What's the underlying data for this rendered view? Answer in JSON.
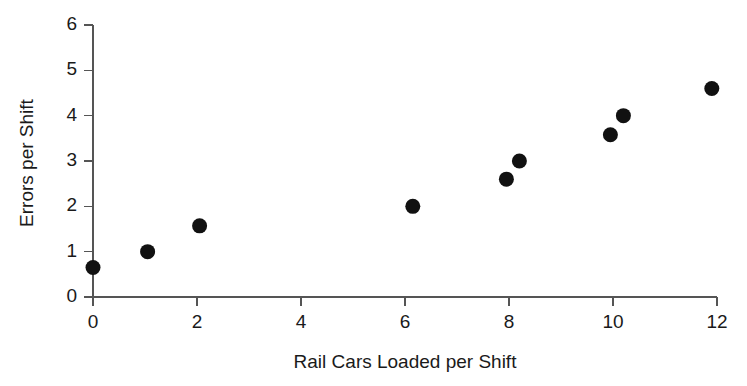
{
  "chart_data": {
    "type": "scatter",
    "title": "",
    "xlabel": "Rail Cars Loaded per Shift",
    "ylabel": "Errors per Shift",
    "xlim": [
      0,
      12
    ],
    "ylim": [
      0,
      6
    ],
    "xticks": [
      0,
      2,
      4,
      6,
      8,
      10,
      12
    ],
    "yticks": [
      0,
      1,
      2,
      3,
      4,
      5,
      6
    ],
    "xtick_labels": [
      "0",
      "2",
      "4",
      "6",
      "8",
      "10",
      "12"
    ],
    "ytick_labels": [
      "0",
      "1",
      "2",
      "3",
      "4",
      "5",
      "6"
    ],
    "grid": false,
    "legend": null,
    "marker": "filled-circle",
    "marker_color": "#111111",
    "axis_color": "#555555",
    "background_color": "#ffffff",
    "points": [
      {
        "x": 0.0,
        "y": 0.65
      },
      {
        "x": 1.05,
        "y": 1.0
      },
      {
        "x": 2.05,
        "y": 1.57
      },
      {
        "x": 6.15,
        "y": 2.0
      },
      {
        "x": 7.95,
        "y": 2.6
      },
      {
        "x": 8.2,
        "y": 3.0
      },
      {
        "x": 9.95,
        "y": 3.58
      },
      {
        "x": 10.2,
        "y": 4.0
      },
      {
        "x": 11.9,
        "y": 4.6
      }
    ]
  },
  "axes": {
    "x_title": "Rail Cars Loaded per Shift",
    "y_title": "Errors per Shift"
  }
}
